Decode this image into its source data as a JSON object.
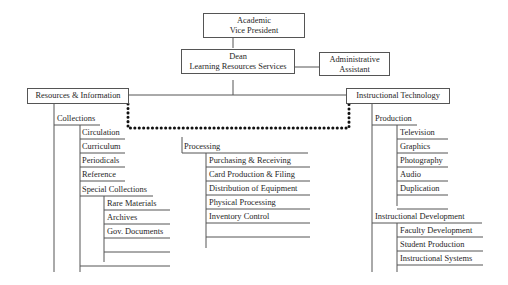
{
  "chart": {
    "top": {
      "line1": "Academic",
      "line2": "Vice President"
    },
    "dean": {
      "line1": "Dean",
      "line2": "Learning Resources Services"
    },
    "assistant": {
      "line1": "Administrative",
      "line2": "Assistant"
    },
    "left_division": "Resources & Information",
    "right_division": "Instructional Technology",
    "collections": {
      "label": "Collections",
      "items": [
        "Circulation",
        "Curriculum",
        "Periodicals",
        "Reference",
        "Special Collections"
      ],
      "special": [
        "Rare Materials",
        "Archives",
        "Gov. Documents"
      ]
    },
    "processing": {
      "label": "Processing",
      "items": [
        "Purchasing & Receiving",
        "Card Production & Filing",
        "Distribution of Equipment",
        "Physical Processing",
        "Inventory Control"
      ]
    },
    "production": {
      "label": "Production",
      "items": [
        "Television",
        "Graphics",
        "Photography",
        "Audio",
        "Duplication"
      ]
    },
    "development": {
      "label": "Instructional Development",
      "items": [
        "Faculty Development",
        "Student Production",
        "Instructional Systems"
      ]
    }
  }
}
